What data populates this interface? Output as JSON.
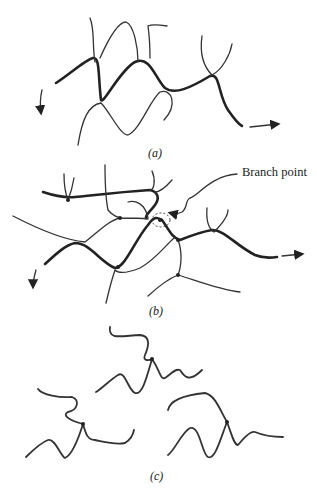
{
  "panels": [
    {
      "id": "a",
      "caption": "(a)",
      "description": "Linear polymer chains, entangled"
    },
    {
      "id": "b",
      "caption": "(b)",
      "description": "Branched / crosslinked polymer network"
    },
    {
      "id": "c",
      "caption": "(c)",
      "description": "Separate branched molecules"
    }
  ],
  "annotations": {
    "branch_point": "Branch point"
  }
}
